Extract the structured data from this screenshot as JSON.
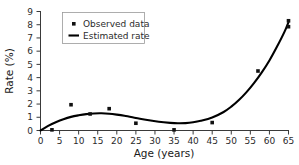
{
  "chart_data": {
    "type": "scatter",
    "title": "",
    "subtitle": "",
    "xlabel": "Age (years)",
    "ylabel": "Rate (%)",
    "xlim": [
      0,
      65
    ],
    "ylim": [
      0,
      9
    ],
    "xticks": [
      0,
      5,
      10,
      15,
      20,
      25,
      30,
      35,
      40,
      45,
      50,
      55,
      60,
      65
    ],
    "yticks": [
      0,
      1,
      2,
      3,
      4,
      5,
      6,
      7,
      8,
      9
    ],
    "xtick_labels": [
      "0",
      "5",
      "10",
      "15",
      "20",
      "25",
      "30",
      "35",
      "40",
      "45",
      "50",
      "55",
      "60",
      "65"
    ],
    "ytick_labels": [
      "0",
      "1",
      "2",
      "3",
      "4",
      "5",
      "6",
      "7",
      "8",
      "9"
    ],
    "grid": false,
    "legend_position": "upper left",
    "series": [
      {
        "name": "Observed data",
        "type": "scatter",
        "marker": "square",
        "color": "#111111",
        "points": [
          {
            "x": 3,
            "y": 0.05
          },
          {
            "x": 8,
            "y": 1.95
          },
          {
            "x": 13,
            "y": 1.25
          },
          {
            "x": 18,
            "y": 1.65
          },
          {
            "x": 25,
            "y": 0.55
          },
          {
            "x": 35,
            "y": 0.05
          },
          {
            "x": 45,
            "y": 0.6
          },
          {
            "x": 57,
            "y": 4.5
          },
          {
            "x": 65,
            "y": 7.85
          },
          {
            "x": 65,
            "y": 8.3
          }
        ]
      },
      {
        "name": "Estimated rate",
        "type": "line",
        "color": "#000000",
        "points": [
          {
            "x": 0,
            "y": 0.0
          },
          {
            "x": 2,
            "y": 0.35
          },
          {
            "x": 4,
            "y": 0.62
          },
          {
            "x": 6,
            "y": 0.85
          },
          {
            "x": 8,
            "y": 1.03
          },
          {
            "x": 10,
            "y": 1.15
          },
          {
            "x": 12,
            "y": 1.24
          },
          {
            "x": 14,
            "y": 1.29
          },
          {
            "x": 16,
            "y": 1.3
          },
          {
            "x": 18,
            "y": 1.27
          },
          {
            "x": 20,
            "y": 1.2
          },
          {
            "x": 22,
            "y": 1.11
          },
          {
            "x": 25,
            "y": 0.95
          },
          {
            "x": 28,
            "y": 0.79
          },
          {
            "x": 31,
            "y": 0.66
          },
          {
            "x": 34,
            "y": 0.58
          },
          {
            "x": 36,
            "y": 0.55
          },
          {
            "x": 38,
            "y": 0.56
          },
          {
            "x": 40,
            "y": 0.62
          },
          {
            "x": 42,
            "y": 0.73
          },
          {
            "x": 45,
            "y": 0.98
          },
          {
            "x": 48,
            "y": 1.4
          },
          {
            "x": 50,
            "y": 1.8
          },
          {
            "x": 52,
            "y": 2.3
          },
          {
            "x": 54,
            "y": 2.9
          },
          {
            "x": 56,
            "y": 3.6
          },
          {
            "x": 58,
            "y": 4.4
          },
          {
            "x": 60,
            "y": 5.3
          },
          {
            "x": 62,
            "y": 6.35
          },
          {
            "x": 64,
            "y": 7.5
          },
          {
            "x": 65,
            "y": 8.2
          }
        ]
      }
    ],
    "legend": [
      {
        "label": "Observed data",
        "marker": "square",
        "color": "#111111"
      },
      {
        "label": "Estimated rate",
        "marker": "line",
        "color": "#000000"
      }
    ]
  }
}
